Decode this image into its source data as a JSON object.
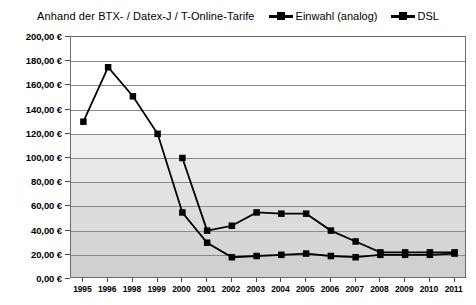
{
  "chart_data": {
    "type": "line",
    "title": "Anhand der BTX- / Datex-J / T-Online-Tarife",
    "xlabel": "",
    "ylabel": "",
    "ylim": [
      0,
      200
    ],
    "ytick_step": 20,
    "grid": true,
    "legend_position": "top-right",
    "currency_symbol": "€",
    "categories": [
      "1995",
      "1996",
      "1998",
      "1999",
      "2000",
      "2001",
      "2002",
      "2003",
      "2004",
      "2005",
      "2006",
      "2007",
      "2008",
      "2009",
      "2010",
      "2011"
    ],
    "ytick_labels": [
      "200,00 €",
      "180,00 €",
      "160,00 €",
      "140,00 €",
      "120,00 €",
      "100,00 €",
      "80,00 €",
      "60,00 €",
      "40,00 €",
      "20,00 €",
      "0,00 €"
    ],
    "ytick_values": [
      200,
      180,
      160,
      140,
      120,
      100,
      80,
      60,
      40,
      20,
      0
    ],
    "series": [
      {
        "name": "Einwahl (analog)",
        "color": "#000000",
        "values": [
          130,
          175,
          151,
          120,
          55,
          30,
          18,
          19,
          20,
          21,
          19,
          18,
          20,
          20,
          20,
          21
        ]
      },
      {
        "name": "DSL",
        "color": "#000000",
        "values": [
          null,
          null,
          null,
          null,
          100,
          40,
          44,
          55,
          54,
          54,
          40,
          31,
          22,
          22,
          22,
          22
        ]
      }
    ]
  },
  "legend": {
    "items": [
      {
        "label": "Einwahl (analog)"
      },
      {
        "label": "DSL"
      }
    ]
  }
}
